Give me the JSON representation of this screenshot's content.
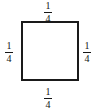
{
  "figure": {
    "shape": "square",
    "stroke_color": "#1a1a1a",
    "fill_color": "#ffffff",
    "text_color": "#161616"
  },
  "labels": {
    "top": {
      "numerator": "1",
      "denominator": "4",
      "value": "1/4"
    },
    "right": {
      "numerator": "1",
      "denominator": "4",
      "value": "1/4"
    },
    "bottom": {
      "numerator": "1",
      "denominator": "4",
      "value": "1/4"
    },
    "left": {
      "numerator": "1",
      "denominator": "4",
      "value": "1/4"
    }
  },
  "chart_data": {
    "type": "diagram",
    "shape": "square",
    "side_labels": [
      "1/4",
      "1/4",
      "1/4",
      "1/4"
    ],
    "side_label_positions": [
      "top",
      "right",
      "bottom",
      "left"
    ],
    "side_length_value": 0.25,
    "title": "",
    "units": ""
  }
}
